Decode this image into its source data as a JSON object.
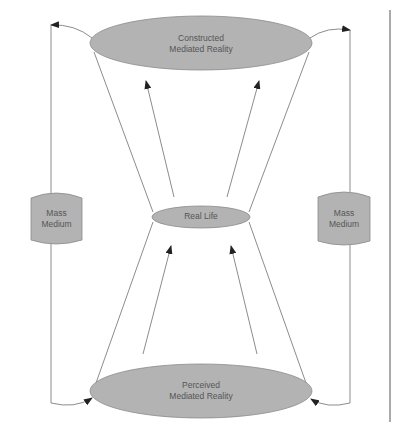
{
  "diagram": {
    "colors": {
      "node_fill": "#b3b3b3",
      "node_stroke": "#8a8a8a",
      "line": "#6e6e6e",
      "text": "#555555",
      "background": "#ffffff"
    },
    "nodes": {
      "constructed": {
        "line1": "Constructed",
        "line2": "Mediated Reality"
      },
      "real_life": {
        "label": "Real Life"
      },
      "perceived": {
        "line1": "Perceived",
        "line2": "Mediated Reality"
      },
      "mass_medium_left": {
        "line1": "Mass",
        "line2": "Medium"
      },
      "mass_medium_right": {
        "line1": "Mass",
        "line2": "Medium"
      }
    },
    "edges": [
      {
        "from": "real_life",
        "to": "constructed",
        "count": 2
      },
      {
        "from": "perceived",
        "to": "real_life",
        "count": 2
      },
      {
        "from": "constructed",
        "to": "mass_medium_left",
        "via": "left loop"
      },
      {
        "from": "mass_medium_left",
        "to": "perceived",
        "via": "left loop"
      },
      {
        "from": "constructed",
        "to": "mass_medium_right",
        "via": "right loop"
      },
      {
        "from": "mass_medium_right",
        "to": "perceived",
        "via": "right loop"
      }
    ]
  }
}
